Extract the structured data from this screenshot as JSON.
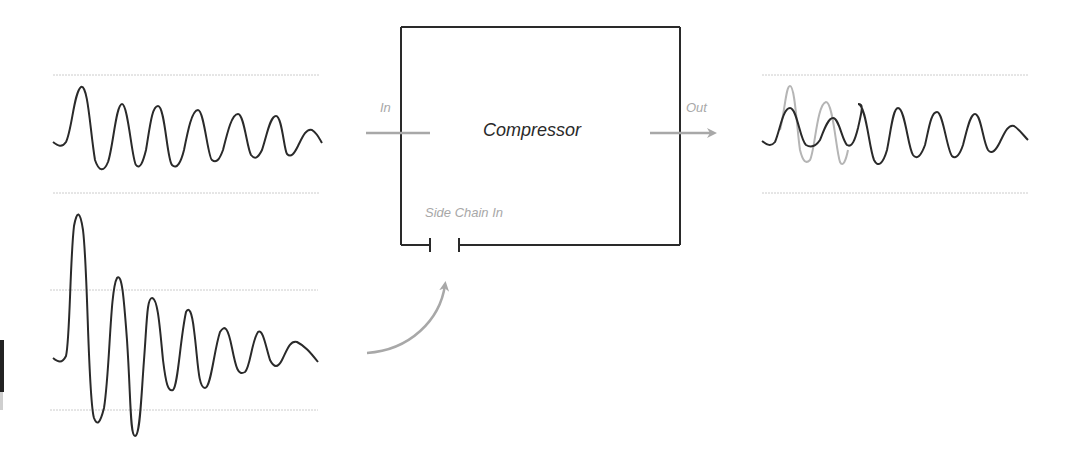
{
  "diagram": {
    "title": "Compressor",
    "box_label": "Compressor",
    "ports": {
      "in": "In",
      "out": "Out",
      "side_chain_in": "Side Chain In"
    },
    "colors": {
      "stroke": "#2a2a2a",
      "arrow": "#a8a8a8",
      "guide": "#cccccc",
      "original_signal": "#b5b5b5"
    },
    "signals": [
      {
        "id": "input-signal",
        "description": "Decaying oscillating waveform feeding the compressor input"
      },
      {
        "id": "sidechain-signal",
        "description": "Large-amplitude decaying waveform feeding the side chain input"
      },
      {
        "id": "output-signal",
        "description": "Compressed output waveform with first peaks attenuated; original shown as light grey overlay"
      }
    ]
  }
}
